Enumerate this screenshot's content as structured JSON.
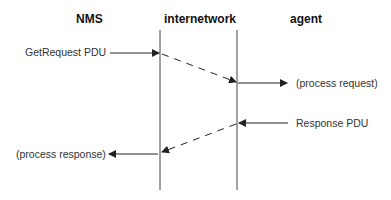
{
  "headers": {
    "nms": "NMS",
    "internetwork": "internetwork",
    "agent": "agent"
  },
  "messages": {
    "get_request": "GetRequest PDU",
    "process_request": "(process request)",
    "response": "Response PDU",
    "process_response": "(process response)"
  },
  "colors": {
    "line": "#333333",
    "text": "#333333",
    "background": "#ffffff"
  }
}
